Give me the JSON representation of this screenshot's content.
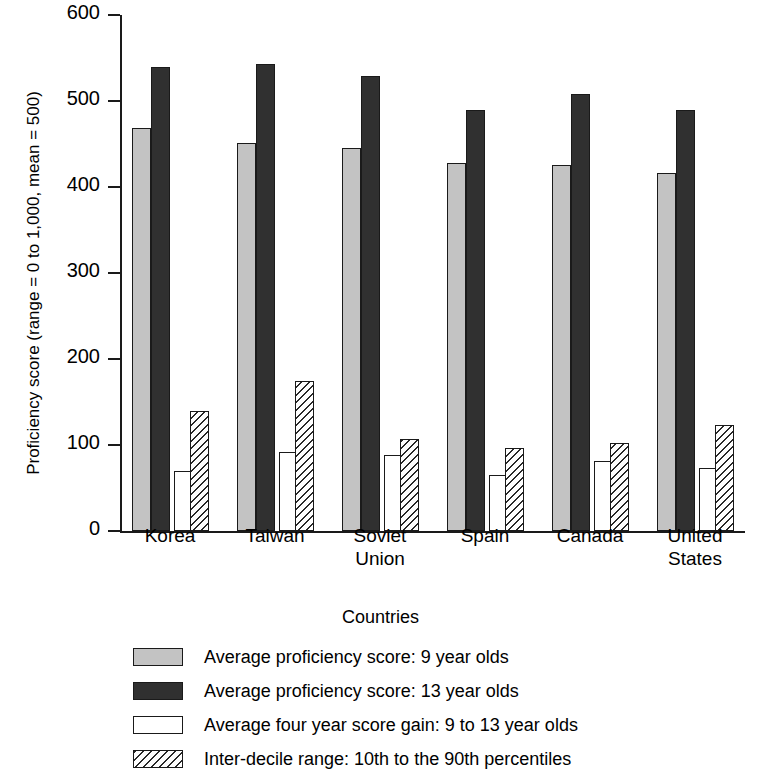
{
  "chart_data": {
    "type": "bar",
    "title": "",
    "xlabel": "Countries",
    "ylabel": "Proficiency score (range = 0 to 1,000, mean = 500)",
    "categories": [
      "Korea",
      "Taiwan",
      "Soviet Union",
      "Spain",
      "Canada",
      "United States"
    ],
    "category_lines": [
      [
        "Korea"
      ],
      [
        "Taiwan"
      ],
      [
        "Soviet",
        "Union"
      ],
      [
        "Spain"
      ],
      [
        "Canada"
      ],
      [
        "United",
        "States"
      ]
    ],
    "ylim": [
      0,
      600
    ],
    "yticks": [
      0,
      100,
      200,
      300,
      400,
      500,
      600
    ],
    "ytick_labels": [
      "0",
      "100",
      "200",
      "300",
      "400",
      "500",
      "600"
    ],
    "grid": false,
    "legend_position": "below",
    "series": [
      {
        "name": "Average proficiency score: 9 year olds",
        "key": "s9",
        "color": "#c3c3c3",
        "values": [
          469,
          451,
          445,
          428,
          426,
          416
        ]
      },
      {
        "name": "Average proficiency score: 13 year olds",
        "key": "s13",
        "color": "#303030",
        "values": [
          539,
          543,
          529,
          490,
          508,
          490
        ]
      },
      {
        "name": "Average four year score gain: 9 to 13 year olds",
        "key": "gain",
        "color": "#ffffff",
        "values": [
          70,
          92,
          88,
          65,
          81,
          73
        ]
      },
      {
        "name": "Inter-decile range: 10th to the 90th percentiles",
        "key": "decile",
        "color": "hatched",
        "values": [
          139,
          175,
          107,
          97,
          102,
          123
        ]
      }
    ]
  },
  "legend": {
    "items": [
      {
        "label": "Average proficiency score: 9 year olds",
        "swatch": "s9"
      },
      {
        "label": "Average proficiency score: 13 year olds",
        "swatch": "s13"
      },
      {
        "label": "Average four year score gain: 9 to 13 year olds",
        "swatch": "gain"
      },
      {
        "label": "Inter-decile range: 10th to the 90th percentiles",
        "swatch": "decile"
      }
    ]
  }
}
